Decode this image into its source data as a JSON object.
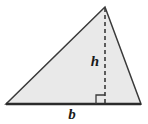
{
  "figure": {
    "kind": "geometry-diagram",
    "canvas": {
      "width": 148,
      "height": 124,
      "background": "#ffffff"
    },
    "shape": {
      "name": "triangle",
      "fill": "#e9e9e9",
      "stroke": "#3a3a3a",
      "stroke_width": 1.5,
      "vertices": [
        {
          "name": "apex",
          "x": 105,
          "y": 7
        },
        {
          "name": "bottom-left",
          "x": 6,
          "y": 104
        },
        {
          "name": "bottom-right",
          "x": 141,
          "y": 104
        }
      ],
      "points_path": "105,7 6,104 141,104"
    },
    "base_line": {
      "stroke": "#2b2b2b",
      "stroke_width": 2.4,
      "x1": 6,
      "y1": 104,
      "x2": 141,
      "y2": 104
    },
    "altitude": {
      "stroke": "#3a3a3a",
      "stroke_width": 1.6,
      "dash_pattern": "4,3",
      "x1": 105,
      "y1": 8,
      "x2": 105,
      "y2": 104
    },
    "right_angle_marker": {
      "stroke": "#3a3a3a",
      "stroke_width": 1.3,
      "size": 9,
      "path": "M 96,104 L 96,95 L 105,95"
    },
    "labels": {
      "height": {
        "text": "h",
        "x": 95,
        "y": 66,
        "font_size": 15
      },
      "base": {
        "text": "b",
        "x": 72,
        "y": 119,
        "font_size": 15
      }
    }
  }
}
